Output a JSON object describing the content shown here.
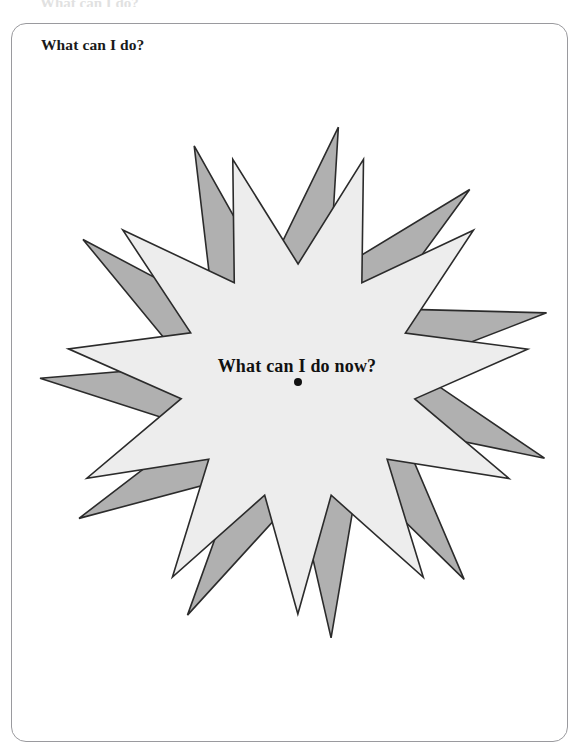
{
  "page": {
    "background_color": "#ffffff",
    "width": 579,
    "height": 753,
    "top_crop_remnant": "What can I do?"
  },
  "card": {
    "border_color": "#9a9a9e",
    "background_color": "#ffffff",
    "corner_radius_px": 15,
    "title": "What can I do?"
  },
  "figure": {
    "name": "two-overlapping-starbursts",
    "center_label": "What can I do now?",
    "center_dot": {
      "label": "center-point",
      "color": "#111111",
      "radius_px": 4
    },
    "stars": [
      {
        "id": "back-star",
        "style": "skewed",
        "points": 11,
        "fill": "#b0b0b0",
        "stroke": "#2b2b2b",
        "stroke_width": 1.6,
        "outer_radius_px": 258,
        "inner_radius_px": 112,
        "rotation_deg": 0,
        "skew_deg": 9
      },
      {
        "id": "front-star",
        "style": "symmetric",
        "points": 11,
        "fill": "#ededed",
        "stroke": "#2b2b2b",
        "stroke_width": 1.6,
        "outer_radius_px": 232,
        "inner_radius_px": 118,
        "rotation_deg": 16.4,
        "skew_deg": 0
      }
    ]
  },
  "chart_data": {
    "type": "scatter",
    "title": "What can I do?",
    "annotations": [
      "What can I do now?"
    ],
    "series": [
      {
        "name": "center-point",
        "x": [
          0
        ],
        "y": [
          0
        ]
      }
    ],
    "xlabel": "",
    "ylabel": "",
    "grid": false,
    "legend": "none"
  }
}
